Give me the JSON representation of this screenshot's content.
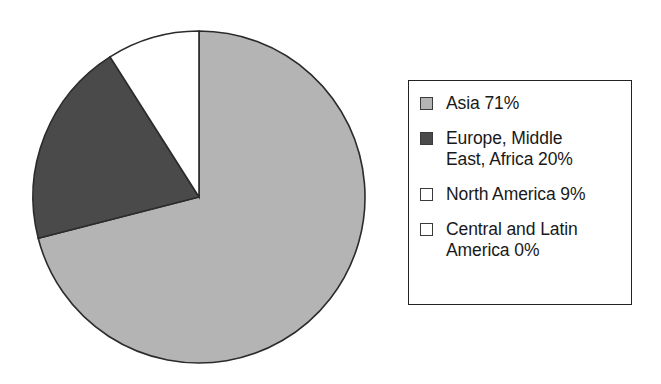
{
  "chart_data": {
    "type": "pie",
    "title": "",
    "categories": [
      "Asia",
      "Europe, Middle East, Africa",
      "North America",
      "Central and Latin America"
    ],
    "values": [
      71,
      20,
      9,
      0
    ],
    "value_unit": "%",
    "labels": [
      "Asia 71%",
      "Europe, Middle\nEast, Africa 20%",
      "North America 9%",
      "Central and Latin\nAmerica 0%"
    ],
    "colors": [
      "#b4b4b4",
      "#4a4a4a",
      "#ffffff",
      "#ffffff"
    ],
    "start_angle_deg": 0,
    "direction": "clockwise",
    "legend_position": "right",
    "grid": false,
    "xlabel": "",
    "ylabel": ""
  },
  "pie": {
    "center_x": 199,
    "center_y": 197,
    "radius": 166,
    "outline_color": "#2b2b2b",
    "slices": [
      {
        "name": "Asia",
        "value": 71,
        "color": "#b4b4b4",
        "start_deg": 0,
        "sweep_deg": 255.6
      },
      {
        "name": "Europe, Middle East, Africa",
        "value": 20,
        "color": "#4a4a4a",
        "start_deg": 255.6,
        "sweep_deg": 72
      },
      {
        "name": "North America",
        "value": 9,
        "color": "#ffffff",
        "start_deg": 327.6,
        "sweep_deg": 32.4
      },
      {
        "name": "Central and Latin America",
        "value": 0,
        "color": "#ffffff",
        "start_deg": 360,
        "sweep_deg": 0
      }
    ]
  },
  "legend": {
    "items": [
      {
        "label": "Asia 71%",
        "swatch_color": "#b4b4b4",
        "swatch_name": "legend-swatch-asia"
      },
      {
        "label": "Europe, Middle\nEast, Africa 20%",
        "swatch_color": "#4a4a4a",
        "swatch_name": "legend-swatch-europe-middle-east-africa"
      },
      {
        "label": "North America 9%",
        "swatch_color": "#ffffff",
        "swatch_name": "legend-swatch-north-america"
      },
      {
        "label": "Central and Latin\nAmerica 0%",
        "swatch_color": "#ffffff",
        "swatch_name": "legend-swatch-central-and-latin-america"
      }
    ]
  }
}
